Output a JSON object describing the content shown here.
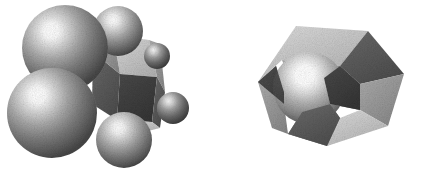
{
  "figure": {
    "title": "Two grayscale rendered models: a sphere cluster around a faceted polyhedron, and a faceted polyhedron enclosing a sphere",
    "background_color": "#ffffff",
    "width": 421,
    "height": 173,
    "style": "dithered halftone grayscale raster illustration",
    "palette": {
      "background": "#ffffff",
      "sphere_highlight": "#ffffff",
      "sphere_midtone": "#8e8e8e",
      "sphere_shadow": "#4a4a4a",
      "sphere_rim": "#3a3a3a",
      "facet_light": "#c9c9c9",
      "facet_mid": "#9a9a9a",
      "facet_dark": "#5c5c5c",
      "facet_darkest": "#3f3f3f",
      "outline": "#2b2b2b"
    },
    "lighting": {
      "direction": "upper-right",
      "highlight_offset_x_pct": 34,
      "highlight_offset_y_pct": 30
    }
  },
  "objects": [
    {
      "id": "left-model",
      "name": "sphere-cluster-model",
      "label": "Left model: polyhedron surrounded by spheres",
      "bbox": {
        "x": 8,
        "y": 4,
        "width": 190,
        "height": 166
      },
      "core": {
        "name": "central-polyhedron",
        "kind": "faceted-polyhedron",
        "facet_count": 6
      },
      "spheres": [
        {
          "name": "sphere-large-upper-left",
          "cx": 65,
          "cy": 48,
          "r": 43,
          "size": "large",
          "tone": "mid"
        },
        {
          "name": "sphere-large-lower-left",
          "cx": 52,
          "cy": 113,
          "r": 45,
          "size": "large",
          "tone": "mid"
        },
        {
          "name": "sphere-medium-upper-right",
          "cx": 118,
          "cy": 31,
          "r": 25,
          "size": "medium",
          "tone": "mid"
        },
        {
          "name": "sphere-medium-lower-center",
          "cx": 124,
          "cy": 140,
          "r": 28,
          "size": "medium",
          "tone": "mid"
        },
        {
          "name": "sphere-small-right-upper",
          "cx": 157,
          "cy": 56,
          "r": 13,
          "size": "small",
          "tone": "dark"
        },
        {
          "name": "sphere-small-right-lower",
          "cx": 173,
          "cy": 108,
          "r": 16,
          "size": "small",
          "tone": "dark"
        }
      ]
    },
    {
      "id": "right-model",
      "name": "faceted-polyhedron-model",
      "label": "Right model: faceted polyhedron with embedded sphere",
      "bbox": {
        "x": 258,
        "y": 24,
        "width": 146,
        "height": 122
      },
      "core": {
        "name": "outer-polyhedron",
        "kind": "faceted-polyhedron",
        "facet_count": 9
      },
      "spheres": [
        {
          "name": "sphere-embedded-left",
          "cx": 309,
          "cy": 88,
          "r": 36,
          "size": "large",
          "tone": "light"
        }
      ]
    }
  ]
}
